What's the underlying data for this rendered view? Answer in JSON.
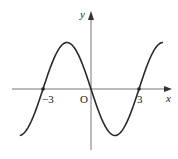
{
  "chart_data": {
    "type": "line",
    "title": "",
    "xlabel": "x",
    "ylabel": "y",
    "origin_label": "O",
    "x_ticks": [
      {
        "value": -3,
        "label": "-3"
      },
      {
        "value": 3,
        "label": "3"
      }
    ],
    "marked_points": [
      {
        "x": -3,
        "y": 0
      },
      {
        "x": 0,
        "y": 0
      },
      {
        "x": 3,
        "y": 0
      }
    ],
    "series": [
      {
        "name": "f(x)",
        "description": "sinusoidal curve through origin, decreasing at x=0; max between -3 and 0, min between 0 and 3",
        "x": [
          -4.45,
          -4,
          -3.5,
          -3,
          -2.5,
          -2,
          -1.5,
          -1,
          -0.5,
          0,
          0.5,
          1,
          1.5,
          2,
          2.5,
          3,
          3.5,
          4,
          4.5
        ],
        "y": [
          -0.98,
          -0.87,
          -0.5,
          0,
          0.5,
          0.87,
          1,
          0.87,
          0.5,
          0,
          -0.5,
          -0.87,
          -1,
          -0.87,
          -0.5,
          0,
          0.5,
          0.87,
          1
        ]
      }
    ],
    "xlim": [
      -5,
      5
    ],
    "ylim": [
      -1.3,
      1.6
    ],
    "grid": false,
    "legend": "none"
  },
  "labels": {
    "y_axis": "y",
    "x_axis": "x",
    "origin": "O",
    "tick_neg3": "−3",
    "tick_pos3": "3"
  }
}
